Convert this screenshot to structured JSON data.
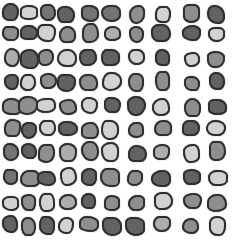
{
  "image": {
    "description": "Grid of irregular rounded gray blobs with dark outlines on a white background",
    "background": "#ffffff",
    "outline_color": "#2e2e2e",
    "rows": 10,
    "cols": 10,
    "shades": {
      "dark": "#626262",
      "middark": "#747474",
      "mid": "#8e8e8e",
      "midlight": "#adadad",
      "light": "#d2d2d2"
    },
    "col_x": [
      11,
      29,
      47,
      67,
      89,
      111,
      136,
      162,
      191,
      217
    ],
    "row_y": [
      13,
      33,
      58,
      82,
      106,
      129,
      152,
      177,
      202,
      225
    ],
    "grid": [
      [
        "dark",
        "light",
        "middark",
        "dark",
        "middark",
        "middark",
        "mid",
        "light",
        "mid",
        "dark"
      ],
      [
        "mid",
        "dark",
        "light",
        "mid",
        "mid",
        "midlight",
        "mid",
        "dark",
        "dark",
        "light"
      ],
      [
        "midlight",
        "dark",
        "mid",
        "light",
        "dark",
        "dark",
        "light",
        "dark",
        "light",
        "mid"
      ],
      [
        "dark",
        "light",
        "mid",
        "dark",
        "mid",
        "light",
        "mid",
        "mid",
        "mid",
        "dark"
      ],
      [
        "mid",
        "mid",
        "light",
        "mid",
        "light",
        "dark",
        "dark",
        "light",
        "mid",
        "dark"
      ],
      [
        "mid",
        "dark",
        "light",
        "dark",
        "mid",
        "light",
        "mid",
        "mid",
        "dark",
        "light"
      ],
      [
        "middark",
        "dark",
        "mid",
        "midlight",
        "mid",
        "light",
        "dark",
        "midlight",
        "light",
        "mid"
      ],
      [
        "middark",
        "mid",
        "dark",
        "light",
        "dark",
        "mid",
        "mid",
        "dark",
        "dark",
        "light"
      ],
      [
        "light",
        "mid",
        "light",
        "midlight",
        "dark",
        "mid",
        "mid",
        "light",
        "mid",
        "mid"
      ],
      [
        "dark",
        "mid",
        "dark",
        "light",
        "mid",
        "dark",
        "dark",
        "midlight",
        "mid",
        "light"
      ]
    ]
  }
}
